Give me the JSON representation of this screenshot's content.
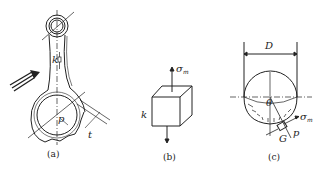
{
  "figure": {
    "panels": [
      {
        "id": "a",
        "caption": "(a)",
        "description": "connecting rod",
        "labels": {
          "k": "k",
          "p": "p",
          "t": "t"
        }
      },
      {
        "id": "b",
        "caption": "(b)",
        "description": "stress element cube",
        "labels": {
          "k": "k",
          "sigma": "σ",
          "sigma_sub": "m"
        }
      },
      {
        "id": "c",
        "caption": "(c)",
        "description": "semicircular section under internal pressure",
        "labels": {
          "D": "D",
          "theta": "θ",
          "sigma": "σ",
          "sigma_sub": "m",
          "G": "G",
          "p": "p"
        }
      }
    ]
  }
}
